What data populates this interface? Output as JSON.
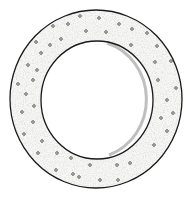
{
  "image": {
    "subject": "Hand-drawn stippled ring (annular disc) with scattered small circular perforations",
    "style": "pen-and-ink line drawing",
    "colors": {
      "background": "#ffffff",
      "outline": "#1a1a1a",
      "fill": "#f7f7f5",
      "stipple": "#9a9a9a",
      "dot": "#3a3a3a",
      "inner_shadow": "#8a8a8a"
    },
    "ring": {
      "outer": {
        "cx": 96,
        "cy": 99,
        "rx": 86,
        "ry": 89
      },
      "inner": {
        "cx": 97,
        "cy": 100,
        "rx": 56,
        "ry": 59
      }
    },
    "dots": [
      [
        80,
        16
      ],
      [
        99,
        18
      ],
      [
        119,
        24
      ],
      [
        132,
        29
      ],
      [
        147,
        33
      ],
      [
        53,
        26
      ],
      [
        68,
        24
      ],
      [
        86,
        31
      ],
      [
        106,
        32
      ],
      [
        61,
        39
      ],
      [
        36,
        42
      ],
      [
        50,
        45
      ],
      [
        41,
        53
      ],
      [
        131,
        45
      ],
      [
        157,
        46
      ],
      [
        28,
        65
      ],
      [
        37,
        70
      ],
      [
        33,
        80
      ],
      [
        155,
        62
      ],
      [
        171,
        61
      ],
      [
        18,
        84
      ],
      [
        26,
        94
      ],
      [
        158,
        80
      ],
      [
        176,
        88
      ],
      [
        167,
        100
      ],
      [
        22,
        112
      ],
      [
        34,
        106
      ],
      [
        33,
        122
      ],
      [
        161,
        118
      ],
      [
        173,
        113
      ],
      [
        24,
        134
      ],
      [
        42,
        141
      ],
      [
        167,
        131
      ],
      [
        154,
        145
      ],
      [
        38,
        153
      ],
      [
        57,
        153
      ],
      [
        71,
        158
      ],
      [
        90,
        165
      ],
      [
        117,
        165
      ],
      [
        130,
        163
      ],
      [
        56,
        170
      ],
      [
        73,
        174
      ],
      [
        100,
        180
      ],
      [
        118,
        180
      ],
      [
        79,
        177
      ]
    ]
  }
}
